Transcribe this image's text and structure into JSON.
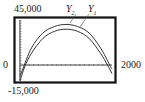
{
  "chart_data": {
    "type": "line",
    "title": "",
    "xlabel": "",
    "ylabel": "",
    "xlim": [
      0,
      2000
    ],
    "ylim": [
      -15000,
      45000
    ],
    "window_labels": {
      "ymax": "45,000",
      "ymin": "-15,000",
      "xmin": "0",
      "xmax": "2000"
    },
    "grid": false,
    "legend_position": "curve labels at top",
    "series": [
      {
        "name": "Y1",
        "label_display": "Y",
        "label_sub": "1",
        "x": [
          0,
          100,
          250,
          500,
          750,
          1000,
          1250,
          1500,
          1750,
          1900,
          2000
        ],
        "values": [
          -14000,
          -1000,
          12000,
          26000,
          32500,
          34500,
          32500,
          26000,
          12000,
          1000,
          -7000
        ]
      },
      {
        "name": "Y2",
        "label_display": "Y",
        "label_sub": "2",
        "x": [
          0,
          50,
          250,
          500,
          750,
          1000,
          1250,
          1500,
          1750,
          1950,
          2000
        ],
        "values": [
          -9000,
          -4000,
          17000,
          31000,
          37000,
          39000,
          37000,
          31000,
          17000,
          1000,
          -3000
        ]
      }
    ]
  },
  "colors": {
    "frame": "#111111",
    "curve": "#333333",
    "axis": "#333333"
  }
}
